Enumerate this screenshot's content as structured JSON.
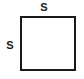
{
  "figure": {
    "type": "geometry-diagram",
    "shape": "square",
    "background_color": "#ffffff",
    "stroke_color": "#1a1a1a",
    "labels": {
      "top": "S",
      "left": "S"
    }
  }
}
